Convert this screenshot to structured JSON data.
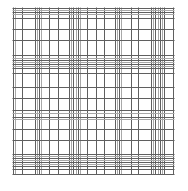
{
  "image": {
    "description": "Plaid / irregular grid pattern of thin gray lines on white background",
    "background_color": "#ffffff",
    "line_color": "#5f5f5f",
    "faint_line_color": "#a8a8a8"
  },
  "grid": {
    "vertical_lines_count": 32,
    "horizontal_lines_count": 32
  }
}
